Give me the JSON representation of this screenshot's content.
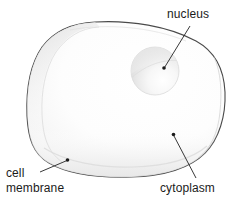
{
  "figure": {
    "background_color": "#ffffff",
    "outline_color": "#4a4a4a",
    "fill_color": "#fcfcfc",
    "shade_color": "#e8e8e8",
    "text_color": "#1b1b1b",
    "leader_color": "#222222"
  },
  "labels": {
    "nucleus": "nucleus",
    "cytoplasm": "cytoplasm",
    "cell_membrane_line1": "cell",
    "cell_membrane_line2": "membrane"
  },
  "parts": [
    {
      "name": "nucleus",
      "label": "nucleus",
      "shape": "sphere",
      "center": [
        155,
        71
      ],
      "radius": 24
    },
    {
      "name": "cytoplasm",
      "label": "cytoplasm",
      "shape": "interior-region",
      "pointer": [
        173,
        134
      ]
    },
    {
      "name": "cell-membrane",
      "label": "cell membrane",
      "shape": "outer-boundary",
      "pointer": [
        68,
        161
      ]
    }
  ],
  "leaders": [
    {
      "name": "nucleus-leader",
      "from": [
        190,
        26
      ],
      "to": [
        164,
        68
      ]
    },
    {
      "name": "cytoplasm-leader",
      "from": [
        196,
        178
      ],
      "to": [
        174,
        136
      ]
    },
    {
      "name": "cell-membrane-leader",
      "from": [
        40,
        172
      ],
      "to": [
        67,
        160
      ]
    }
  ]
}
